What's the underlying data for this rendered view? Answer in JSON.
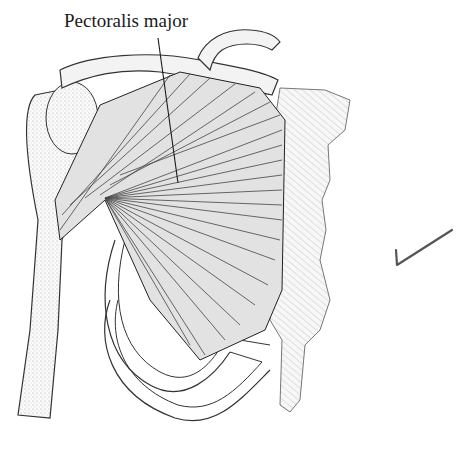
{
  "diagram": {
    "labels": [
      {
        "text": "Pectoralis major",
        "points_to": "pectoralis-major-muscle"
      }
    ],
    "structures": [
      "humerus",
      "clavicle",
      "acromion",
      "sternum",
      "ribs",
      "pectoralis-major-muscle",
      "deltoid-region"
    ],
    "annotation_mark": "checkmark"
  },
  "colors": {
    "background": "#ffffff",
    "ink": "#1a1a1a",
    "bone_fill": "#f4f4f4",
    "stipple": "#9a9a9a",
    "muscle_dark": "#2a2a2a",
    "checkmark": "#555555"
  }
}
